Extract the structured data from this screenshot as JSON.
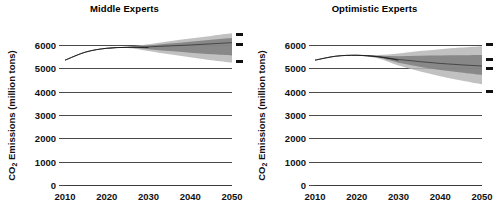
{
  "figure": {
    "axis_label": "CO2 Emissions (million tons)",
    "axis_label_prefix": "CO",
    "axis_label_sub": "2",
    "axis_label_suffix": " Emissions (million tons)",
    "background": "#ffffff",
    "grid_color": "#4a4a4a",
    "fan_color": "#808080",
    "line_color": "#1a1a1a"
  },
  "chart_data": {
    "type": "area",
    "xlabel": "",
    "ylabel": "CO2 Emissions (million tons)",
    "xlim": [
      2010,
      2050
    ],
    "ylim": [
      0,
      6500
    ],
    "xticks": [
      2010,
      2020,
      2030,
      2040,
      2050
    ],
    "yticks": [
      0,
      1000,
      2000,
      3000,
      4000,
      5000,
      6000
    ],
    "ytick_labels": [
      "0",
      "1000",
      "2000",
      "3000",
      "4000",
      "5000",
      "6000"
    ],
    "xtick_labels": [
      "2010",
      "2020",
      "2030",
      "2040",
      "2050"
    ],
    "grid": true,
    "legend": "none",
    "panels": [
      {
        "label": "Middle Experts",
        "x": [
          2010,
          2015,
          2020,
          2025,
          2030,
          2035,
          2040,
          2045,
          2050
        ],
        "historical": [
          5350,
          5700,
          5860,
          5900,
          5890,
          null,
          null,
          null,
          null
        ],
        "median": [
          5350,
          5700,
          5860,
          5900,
          5920,
          5960,
          6000,
          6050,
          6100
        ],
        "band_outer_upper": [
          5350,
          5700,
          5870,
          5930,
          6030,
          6160,
          6280,
          6390,
          6500
        ],
        "band_outer_lower": [
          5350,
          5700,
          5850,
          5870,
          5740,
          5600,
          5470,
          5350,
          5250
        ],
        "band_inner_upper": [
          5350,
          5700,
          5865,
          5915,
          5975,
          6060,
          6140,
          6220,
          6300
        ],
        "band_inner_lower": [
          5350,
          5700,
          5855,
          5885,
          5820,
          5740,
          5670,
          5600,
          5550
        ],
        "endpoint_markers": [
          6450,
          6030,
          5300
        ]
      },
      {
        "label": "Optimistic Experts",
        "x": [
          2010,
          2015,
          2020,
          2025,
          2030,
          2035,
          2040,
          2045,
          2050
        ],
        "historical": [
          5350,
          5520,
          5560,
          5500,
          5350,
          null,
          null,
          null,
          null
        ],
        "median": [
          5350,
          5520,
          5560,
          5500,
          5380,
          5290,
          5210,
          5150,
          5100
        ],
        "band_outer_upper": [
          5350,
          5520,
          5580,
          5570,
          5640,
          5740,
          5820,
          5890,
          5950
        ],
        "band_outer_lower": [
          5350,
          5520,
          5540,
          5430,
          5120,
          4870,
          4660,
          4480,
          4320
        ],
        "band_inner_upper": [
          5350,
          5520,
          5570,
          5540,
          5520,
          5540,
          5550,
          5560,
          5570
        ],
        "band_inner_lower": [
          5350,
          5520,
          5550,
          5460,
          5240,
          5070,
          4930,
          4820,
          4720
        ],
        "endpoint_markers": [
          6030,
          5400,
          4980,
          4020
        ]
      }
    ]
  }
}
